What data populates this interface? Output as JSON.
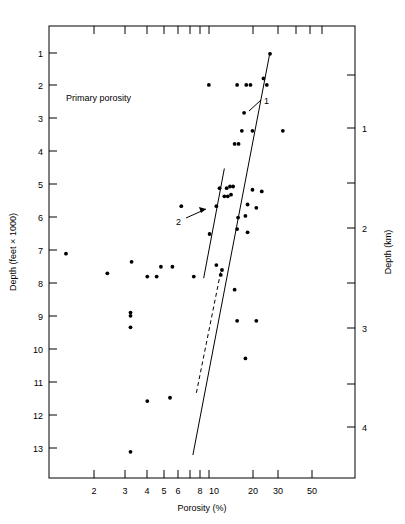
{
  "chart_data": {
    "type": "scatter",
    "title": "Primary porosity",
    "xlabel": "Porosity (%)",
    "ylabel": "Depth (feet × 1000)",
    "ylabel_right": "Depth (km)",
    "xscale": "log",
    "xlim": [
      1.15,
      75
    ],
    "ylim": [
      0,
      13.8
    ],
    "ylim_right_km": [
      0,
      4.2
    ],
    "grid": false,
    "legend": "none",
    "xticks": [
      2,
      3,
      4,
      5,
      6,
      8,
      10,
      20,
      30,
      50
    ],
    "xtick_labels": [
      "2",
      "3",
      "4",
      "5",
      "6",
      "8",
      "10",
      "20",
      "30",
      "50"
    ],
    "xticks_minor": [
      7,
      9,
      40,
      60,
      70
    ],
    "yticks": [
      1,
      2,
      3,
      4,
      5,
      6,
      7,
      8,
      9,
      10,
      11,
      12,
      13
    ],
    "ytick_labels": [
      "1",
      "2",
      "3",
      "4",
      "5",
      "6",
      "7",
      "8",
      "9",
      "10",
      "11",
      "12",
      "13"
    ],
    "yticks_right": [
      1,
      2,
      3,
      4
    ],
    "ytick_right_labels": [
      "1",
      "2",
      "3",
      "4"
    ],
    "yticks_right_minor": [
      0.5,
      1.5,
      2.5,
      3.5
    ],
    "points": [
      {
        "porosity": 23.5,
        "depth_kft": 0.85
      },
      {
        "porosity": 10.2,
        "depth_kft": 1.8
      },
      {
        "porosity": 15.0,
        "depth_kft": 1.8
      },
      {
        "porosity": 17.0,
        "depth_kft": 1.8
      },
      {
        "porosity": 18.0,
        "depth_kft": 1.8
      },
      {
        "porosity": 22.5,
        "depth_kft": 1.8
      },
      {
        "porosity": 21.5,
        "depth_kft": 1.6
      },
      {
        "porosity": 16.5,
        "depth_kft": 2.65
      },
      {
        "porosity": 16.0,
        "depth_kft": 3.2
      },
      {
        "porosity": 18.5,
        "depth_kft": 3.2
      },
      {
        "porosity": 28.0,
        "depth_kft": 3.2
      },
      {
        "porosity": 14.5,
        "depth_kft": 3.6
      },
      {
        "porosity": 15.3,
        "depth_kft": 3.6
      },
      {
        "porosity": 11.8,
        "depth_kft": 4.95
      },
      {
        "porosity": 13.0,
        "depth_kft": 4.95
      },
      {
        "porosity": 13.6,
        "depth_kft": 4.9
      },
      {
        "porosity": 14.2,
        "depth_kft": 4.9
      },
      {
        "porosity": 12.6,
        "depth_kft": 5.2
      },
      {
        "porosity": 13.2,
        "depth_kft": 5.2
      },
      {
        "porosity": 13.8,
        "depth_kft": 5.15
      },
      {
        "porosity": 18.5,
        "depth_kft": 5.0
      },
      {
        "porosity": 21.0,
        "depth_kft": 5.05
      },
      {
        "porosity": 17.3,
        "depth_kft": 5.45
      },
      {
        "porosity": 19.5,
        "depth_kft": 5.55
      },
      {
        "porosity": 15.2,
        "depth_kft": 5.85
      },
      {
        "porosity": 16.8,
        "depth_kft": 5.8
      },
      {
        "porosity": 7.0,
        "depth_kft": 5.5
      },
      {
        "porosity": 11.3,
        "depth_kft": 5.5
      },
      {
        "porosity": 15.0,
        "depth_kft": 6.2
      },
      {
        "porosity": 17.3,
        "depth_kft": 6.3
      },
      {
        "porosity": 10.3,
        "depth_kft": 6.35
      },
      {
        "porosity": 1.45,
        "depth_kft": 6.95
      },
      {
        "porosity": 3.55,
        "depth_kft": 7.2
      },
      {
        "porosity": 5.3,
        "depth_kft": 7.35
      },
      {
        "porosity": 6.2,
        "depth_kft": 7.35
      },
      {
        "porosity": 11.3,
        "depth_kft": 7.3
      },
      {
        "porosity": 2.55,
        "depth_kft": 7.55
      },
      {
        "porosity": 4.4,
        "depth_kft": 7.65
      },
      {
        "porosity": 5.0,
        "depth_kft": 7.65
      },
      {
        "porosity": 8.3,
        "depth_kft": 7.65
      },
      {
        "porosity": 12.0,
        "depth_kft": 7.6
      },
      {
        "porosity": 12.2,
        "depth_kft": 7.45
      },
      {
        "porosity": 14.5,
        "depth_kft": 8.05
      },
      {
        "porosity": 3.5,
        "depth_kft": 8.75
      },
      {
        "porosity": 3.5,
        "depth_kft": 8.85
      },
      {
        "porosity": 15.0,
        "depth_kft": 9.0
      },
      {
        "porosity": 19.5,
        "depth_kft": 9.0
      },
      {
        "porosity": 3.5,
        "depth_kft": 9.2
      },
      {
        "porosity": 16.8,
        "depth_kft": 10.15
      },
      {
        "porosity": 4.4,
        "depth_kft": 11.45
      },
      {
        "porosity": 6.0,
        "depth_kft": 11.35
      },
      {
        "porosity": 3.5,
        "depth_kft": 13.0
      }
    ],
    "trend_lines": [
      {
        "label": "1",
        "style": "solid",
        "from": {
          "porosity": 8.2,
          "depth_kft": 13.1
        },
        "to": {
          "porosity": 23.5,
          "depth_kft": 0.8
        }
      },
      {
        "label": "2",
        "style": "solid",
        "from": {
          "porosity": 9.5,
          "depth_kft": 7.7
        },
        "to": {
          "porosity": 12.6,
          "depth_kft": 4.35
        }
      },
      {
        "label": "dashed-extension",
        "style": "dashed",
        "from": {
          "porosity": 8.6,
          "depth_kft": 11.2
        },
        "to": {
          "porosity": 12.0,
          "depth_kft": 7.5
        }
      }
    ],
    "annotations": [
      {
        "label": "1",
        "x_px": 264,
        "y_px": 101
      },
      {
        "label": "2",
        "x_px": 178,
        "y_px": 221
      }
    ]
  }
}
